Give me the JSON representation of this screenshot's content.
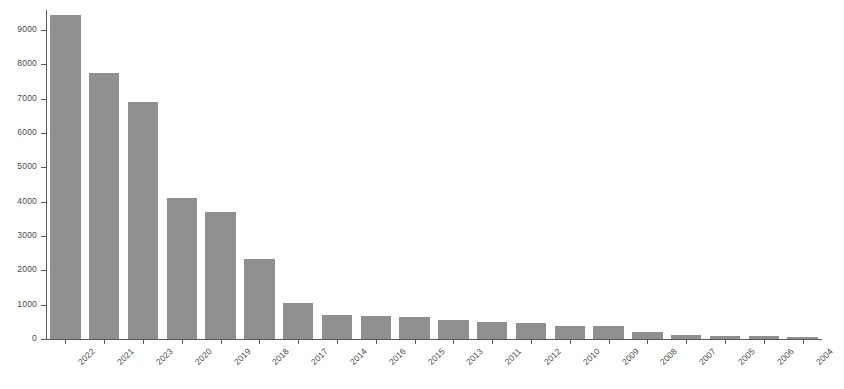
{
  "chart_data": {
    "type": "bar",
    "title": "",
    "subtitle": "",
    "xlabel": "",
    "ylabel": "",
    "categories": [
      "2022",
      "2021",
      "2023",
      "2020",
      "2019",
      "2018",
      "2017",
      "2014",
      "2016",
      "2015",
      "2013",
      "2011",
      "2012",
      "2010",
      "2009",
      "2008",
      "2007",
      "2005",
      "2006",
      "2004"
    ],
    "values": [
      9450,
      7750,
      6900,
      4100,
      3700,
      2330,
      1060,
      700,
      670,
      630,
      550,
      510,
      470,
      390,
      370,
      200,
      120,
      90,
      80,
      60
    ],
    "ylim": [
      0,
      9600
    ],
    "yticks": [
      0,
      1000,
      2000,
      3000,
      4000,
      5000,
      6000,
      7000,
      8000,
      9000
    ],
    "ytick_labels": [
      "0",
      "1000",
      "2000",
      "3000",
      "4000",
      "5000",
      "6000",
      "7000",
      "8000",
      "9000"
    ],
    "grid": false,
    "legend": null,
    "bar_color": "#909090",
    "axis_color": "#5a5a5a",
    "background_color": "#ffffff",
    "xtick_rotation": -45
  }
}
